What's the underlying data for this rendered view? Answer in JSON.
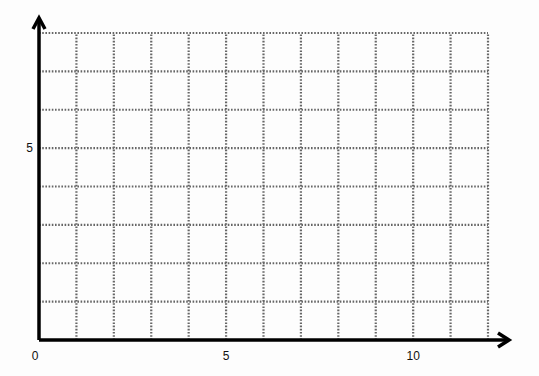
{
  "chart_data": {
    "type": "grid",
    "title": "",
    "xlabel": "",
    "ylabel": "",
    "xlim": [
      0,
      12
    ],
    "ylim": [
      0,
      8
    ],
    "x_ticks": [
      {
        "value": 0,
        "label": "0"
      },
      {
        "value": 5,
        "label": "5"
      },
      {
        "value": 10,
        "label": "10"
      }
    ],
    "y_ticks": [
      {
        "value": 5,
        "label": "5"
      }
    ],
    "grid": {
      "on": true,
      "style": "dotted",
      "x_step": 1,
      "y_step": 1,
      "color": "#666666"
    },
    "axes": {
      "arrows": true,
      "color": "#000000"
    },
    "series": []
  }
}
